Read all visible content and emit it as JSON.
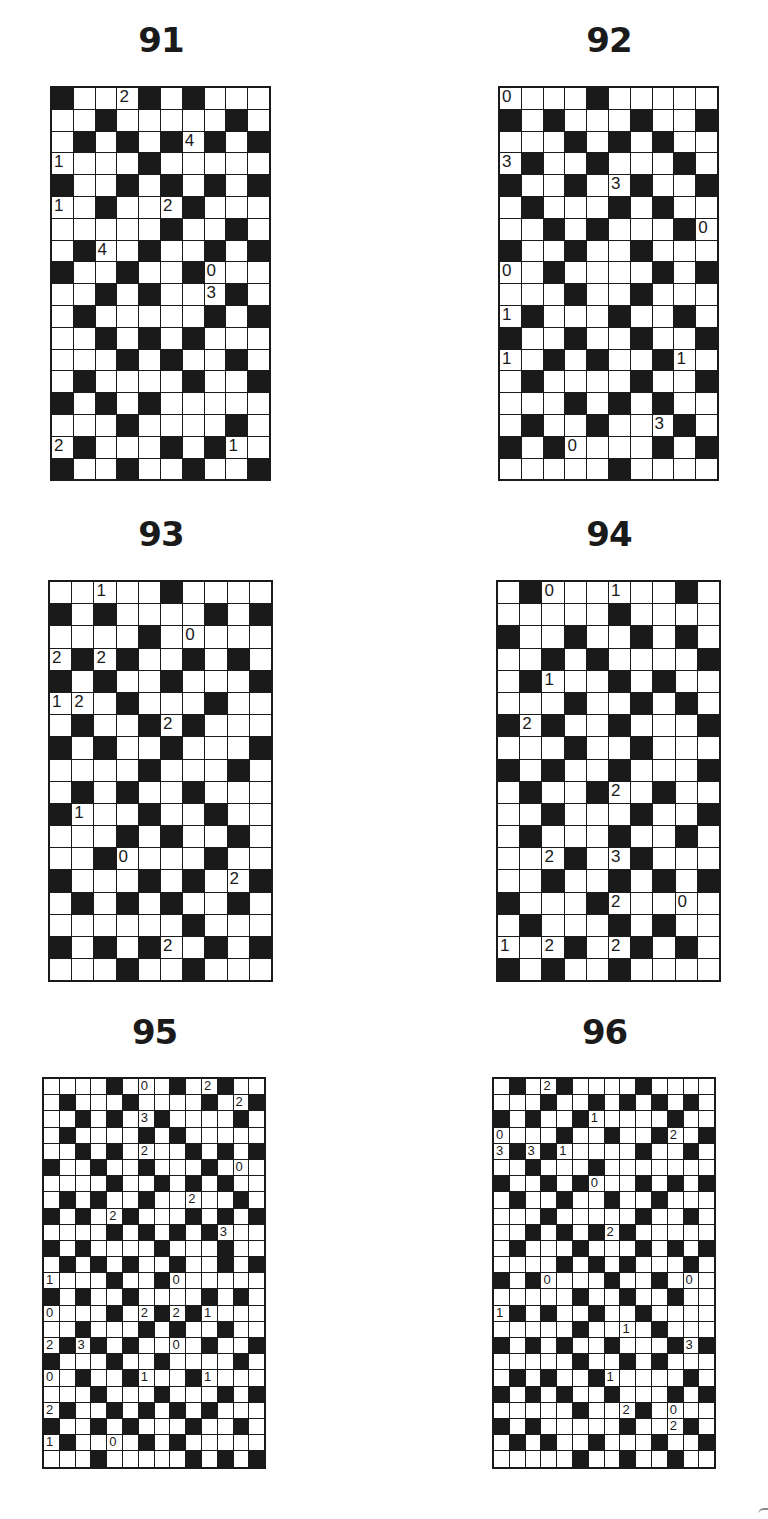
{
  "page": {
    "background": "#ffffff",
    "ink": "#1a1a1a"
  },
  "puzzles": [
    {
      "id": "91",
      "title": "91",
      "cols": 10,
      "rows_count": 18,
      "layout": {
        "left": 50,
        "top": 86,
        "cellW": 21.8,
        "cellH": 21.8,
        "titleTop": 20,
        "fontSize": 17
      },
      "grid": [
        "BWW2BWBWWW",
        "WWBWWWWWBW",
        "WBWBWB4BWB",
        "1WWWBWWWWW",
        "BWWBWBWBWB",
        "1WBWW2BWWW",
        "WWWWWBWWBW",
        "WB4WBWWBWB",
        "BWWBWWB0WW",
        "WWBWBWW3BW",
        "WBWWWWWBWB",
        "WWBWBWBWWW",
        "WWWBWBWWBW",
        "WBWWWWBWWB",
        "BWBWBWWWWW",
        "WWWBWWWWBW",
        "2BWWWBWB1W",
        "BWWBWWBWWB"
      ]
    },
    {
      "id": "92",
      "title": "92",
      "cols": 10,
      "rows_count": 18,
      "layout": {
        "left": 498,
        "top": 86,
        "cellW": 21.8,
        "cellH": 21.8,
        "titleTop": 20,
        "fontSize": 17
      },
      "grid": [
        "0WWWBWWWWW",
        "BWBWWWBWWB",
        "WWWBWBWBWW",
        "3BWWBWWWBW",
        "BWWBW3BWWB",
        "WBWWWBWBWW",
        "WWBWBWWWB0",
        "BWWBWWBWWW",
        "0WBWWWWBWB",
        "WWWBWWBWWW",
        "1BWWWBWWBW",
        "BWWBWWBWWB",
        "1WBWBWWB1W",
        "WBWWWWBWWB",
        "WWWBWBWBWW",
        "WBWWBWW3BW",
        "BWB0WWWBWB",
        "WWWWWBWWWW"
      ]
    },
    {
      "id": "93",
      "title": "93",
      "cols": 10,
      "rows_count": 18,
      "layout": {
        "left": 48,
        "top": 580,
        "cellW": 22.2,
        "cellH": 22.2,
        "titleTop": 514,
        "fontSize": 17
      },
      "grid": [
        "WW1WWBWWWW",
        "BWBWWWWBWB",
        "WWWWBW0WWW",
        "2B2BWWBWBW",
        "BWBWWBWWWB",
        "12WBWWWBWW",
        "WBWWB2BWWW",
        "BWBWWBWWWB",
        "WWWWBWWWBW",
        "WBWBWWBWWW",
        "B1WWBWWBWW",
        "WWWBWBWWBW",
        "WWB0WWWBWW",
        "BWWWBWBW2B",
        "WBWBWBWWBW",
        "WWWWWWBWWW",
        "BWBWB2WBWB",
        "WWWBWWBWWW"
      ]
    },
    {
      "id": "94",
      "title": "94",
      "cols": 10,
      "rows_count": 18,
      "layout": {
        "left": 496,
        "top": 580,
        "cellW": 22.2,
        "cellH": 22.2,
        "titleTop": 514,
        "fontSize": 17
      },
      "grid": [
        "WB0WW1WWBW",
        "WWWWWBWWWW",
        "BWWBWWBWBW",
        "WWBWBWWWWB",
        "WB1WWBWBWW",
        "WWWBWWBWBW",
        "B2BWWBWWWB",
        "WWWBWWBWWW",
        "BWBWWBWWWB",
        "WBWWB2WBWW",
        "WWBWWWBWWB",
        "WBWWWBWWBW",
        "WW2BW3BWWW",
        "WWBWWBWBWB",
        "BWWWB2WW0W",
        "WBWWWBWBWW",
        "1W2BW2BWBW",
        "BWBWWBWWWW"
      ]
    },
    {
      "id": "95",
      "title": "95",
      "cols": 14,
      "rows_count": 24,
      "layout": {
        "left": 42,
        "top": 1077,
        "cellW": 15.8,
        "cellH": 16.2,
        "titleTop": 1012,
        "fontSize": 13
      },
      "grid": [
        "WWWWBW0WBW2BWW",
        "WBWWWBWWWWBW2B",
        "WWBWBW3BWWWWBW",
        "WBWWWWBWBWWWWW",
        "WWBWBW2WWBWBWB",
        "BWWBWWBWWWBW0W",
        "WWWWBWWBWBWBWW",
        "WBWBWWBWW2WWBW",
        "BWBW2BWWWBWBWB",
        "WWWWBWBWBWB3WW",
        "BWBWWWWBWWWBWW",
        "WBWBWBWWBWWBWB",
        "1WWWBWWB0WWWWW",
        "BWBWWBWWWWBWBW",
        "0WWWBW2B2B1WWW",
        "WWBWWWBWBWWBWW",
        "2B3BWBWW0WBWWB",
        "BWWWBWWBWWWWBW",
        "0WBWWB1WWB1WWW",
        "WWWBWWWBWWWBWB",
        "2BWWBWBWBWBWWW",
        "BWWBWBWWWBWWBW",
        "1BWW0WBWBWWWWW",
        "WWWBWWWWWBWBWB"
      ]
    },
    {
      "id": "96",
      "title": "96",
      "cols": 14,
      "rows_count": 24,
      "layout": {
        "left": 492,
        "top": 1077,
        "cellW": 15.8,
        "cellH": 16.2,
        "titleTop": 1012,
        "fontSize": 13
      },
      "grid": [
        "WBW2BWWWWBWWWW",
        "WWWBWWBWBWBWBW",
        "BWBWWB1WWWWBWW",
        "0WWWBWWBWWB2WB",
        "3B3B1WWWWBWWBW",
        "WWBWWWBWWWWWWW",
        "BWWBWB0WWBWBWB",
        "WBWWBWWBWWBWWW",
        "WWWBWWWWWBWWBW",
        "WWBWBWB2BWWWWW",
        "WBWWWBWWWBWBWB",
        "WWWWBWBWBWWWBW",
        "BWB0WWWBWWBW0W",
        "WWWWWBWWBWWBWW",
        "1BWBWWBWWBWWWW",
        "WWWWWBWW1WBWWW",
        "BWBWBWWBWWWB3B",
        "WWWWWBWWBWBWWW",
        "WBWBWWB1WWWWBW",
        "BWBWBWWBWWWBWB",
        "WWWWWBWW2BW0WW",
        "BWBWWWWWBWW2BW",
        "WBWBWWBWWWBWWB",
        "WWWWWBWWBWWBWW"
      ]
    }
  ]
}
